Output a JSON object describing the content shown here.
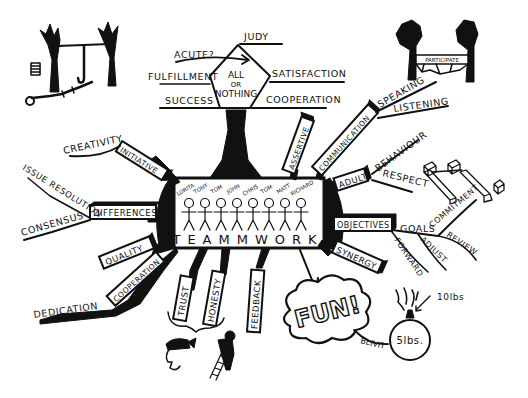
{
  "diagram": {
    "type": "mind-map",
    "central_topic": "TEAMMWORK",
    "team_members": [
      "LORITA",
      "TONY",
      "TOM",
      "JOHN",
      "CHRIS",
      "TOM",
      "MATT",
      "RICHARD"
    ],
    "top_diamond": {
      "lines": [
        "ALL",
        "OR",
        "NOTHING"
      ],
      "branches": {
        "top": "JUDY",
        "arrow_label": "ACUTE?",
        "left_upper": "FULFILLMENT",
        "left_lower": "SUCCESS",
        "right_upper": "SATISFACTION",
        "right_lower": "COOPERATION"
      }
    },
    "boxes": {
      "initiative": "INITIATIVE",
      "differences": "DIFFERENCES",
      "quality": "QUALITY",
      "cooperation": "COOPERATION",
      "trust": "TRUST",
      "honesty": "HONESTY",
      "feedback": "FEEDBACK",
      "synergy": "SYNERGY",
      "objectives": "OBJECTIVES",
      "adult": "ADULT",
      "communication": "COMMUNICATION",
      "assertive": "ASSERTIVE"
    },
    "branch_labels": {
      "creativity": "CREATIVITY",
      "issue_resolution": "ISSUE RESOLUTION",
      "consensus": "CONSENSUS",
      "dedication": "DEDICATION",
      "speaking": "SPEAKING",
      "listening": "LISTENING",
      "behaviour": "BEHAVIOUR",
      "respect": "RESPECT",
      "goals": "GOALS",
      "commitment": "COMMITMENT",
      "review": "REVIEW",
      "adjust": "ADJUST",
      "forward": "FORWARD"
    },
    "fun_cloud": "FUN!",
    "fun_tag": "BLIVIT",
    "bomb": {
      "body": "5lbs.",
      "fuse_label": "10lbs"
    },
    "hammock_banner": "PARTICIPATE"
  }
}
